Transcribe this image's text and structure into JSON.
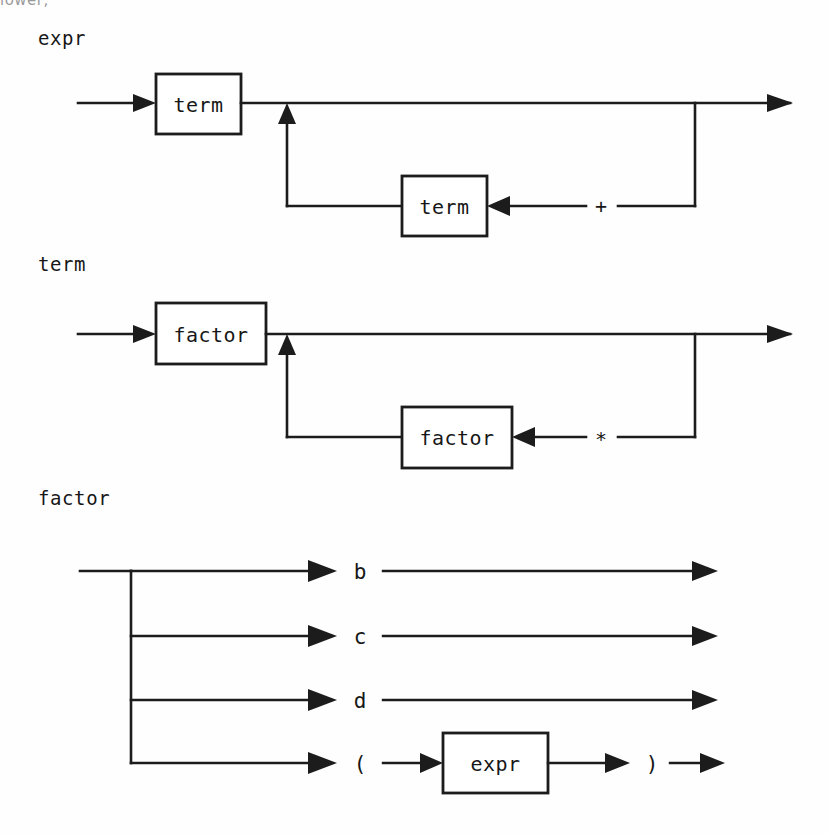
{
  "page": {
    "clipped_header_text": "lower,",
    "background_color": "#fefefe",
    "ink_color": "#1c1c1c"
  },
  "diagrams": [
    {
      "name": "expr",
      "label": "expr",
      "kind": "railroad-repetition",
      "primary_box_label": "term",
      "loop_box_label": "term",
      "separator_label": "+",
      "description": "expr is one or more term separated by +"
    },
    {
      "name": "term",
      "label": "term",
      "kind": "railroad-repetition",
      "primary_box_label": "factor",
      "loop_box_label": "factor",
      "separator_label": "*",
      "description": "term is one or more factor separated by *"
    },
    {
      "name": "factor",
      "label": "factor",
      "kind": "railroad-alternation",
      "alternatives": [
        {
          "id": "b",
          "label": "b",
          "type": "terminal"
        },
        {
          "id": "c",
          "label": "c",
          "type": "terminal"
        },
        {
          "id": "d",
          "label": "d",
          "type": "terminal"
        },
        {
          "id": "paren",
          "type": "group",
          "open_label": "(",
          "box_label": "expr",
          "close_label": ")"
        }
      ]
    }
  ]
}
